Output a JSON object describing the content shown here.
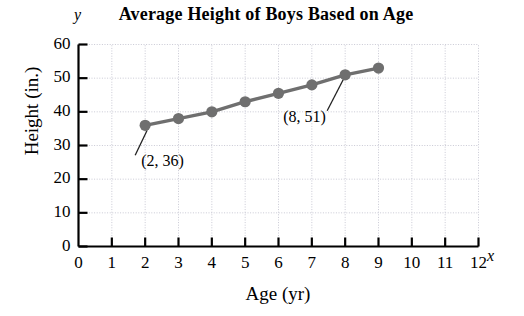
{
  "chart_data": {
    "type": "line",
    "title": "Average Height of Boys Based on Age",
    "xlabel": "Age (yr)",
    "ylabel": "Height (in.)",
    "x_axis_symbol": "x",
    "y_axis_symbol": "y",
    "xlim": [
      0,
      12
    ],
    "ylim": [
      0,
      60
    ],
    "grid": true,
    "legend": "none",
    "xticks": [
      0,
      1,
      2,
      3,
      4,
      5,
      6,
      7,
      8,
      9,
      10,
      11,
      12
    ],
    "xtick_labels": [
      "0",
      "1",
      "2",
      "3",
      "4",
      "5",
      "6",
      "7",
      "8",
      "9",
      "10",
      "11",
      "12"
    ],
    "yticks": [
      0,
      10,
      20,
      30,
      40,
      50,
      60
    ],
    "ytick_labels": [
      "0",
      "10",
      "20",
      "30",
      "40",
      "50",
      "60"
    ],
    "x": [
      2,
      3,
      4,
      5,
      6,
      7,
      8,
      9
    ],
    "values": [
      36,
      38,
      40,
      43,
      45.5,
      48,
      51,
      53
    ],
    "series": [
      {
        "name": "Average height of boys",
        "x": [
          2,
          3,
          4,
          5,
          6,
          7,
          8,
          9
        ],
        "values": [
          36,
          38,
          40,
          43,
          45.5,
          48,
          51,
          53
        ],
        "color": "#6f6f6f",
        "marker": "circle"
      }
    ],
    "annotations": [
      {
        "label": "(2, 36)",
        "point_x": 2,
        "point_y": 36
      },
      {
        "label": "(8, 51)",
        "point_x": 8,
        "point_y": 51
      }
    ],
    "colors": {
      "line": "#6f6f6f",
      "marker": "#6f6f6f",
      "axis": "#000000",
      "grid": "#c9c9d4",
      "text": "#000000",
      "background": "#ffffff"
    }
  }
}
